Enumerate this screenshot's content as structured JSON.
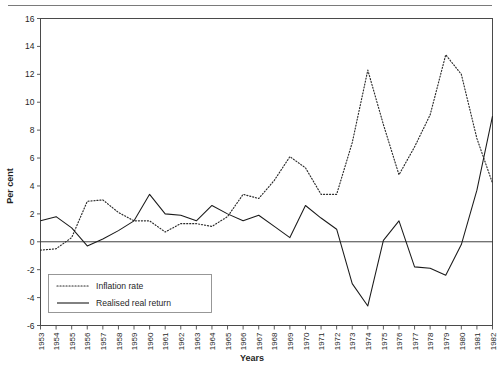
{
  "chart_data": {
    "type": "line",
    "title": "",
    "xlabel": "Years",
    "ylabel": "Per cent",
    "ylim": [
      -6,
      16
    ],
    "ytick_step": 2,
    "yticks": [
      16,
      14,
      12,
      10,
      8,
      6,
      4,
      2,
      0,
      -2,
      -4,
      -6
    ],
    "grid": false,
    "legend_position": "bottom-left",
    "zero_line": true,
    "x": [
      1953,
      1954,
      1955,
      1956,
      1957,
      1958,
      1959,
      1960,
      1961,
      1962,
      1963,
      1964,
      1965,
      1966,
      1967,
      1968,
      1969,
      1970,
      1971,
      1972,
      1973,
      1974,
      1975,
      1976,
      1977,
      1978,
      1979,
      1980,
      1981,
      1982
    ],
    "categories": [
      "1953",
      "1954",
      "1955",
      "1956",
      "1957",
      "1958",
      "1959",
      "1960",
      "1961",
      "1962",
      "1963",
      "1964",
      "1965",
      "1966",
      "1967",
      "1968",
      "1969",
      "1970",
      "1971",
      "1972",
      "1973",
      "1974",
      "1975",
      "1976",
      "1977",
      "1978",
      "1979",
      "1980",
      "1981",
      "1982"
    ],
    "series": [
      {
        "name": "Inflation rate",
        "style": "dotted",
        "color": "#2a2a2a",
        "values": [
          -0.6,
          -0.5,
          0.3,
          2.9,
          3.0,
          2.1,
          1.5,
          1.5,
          0.7,
          1.3,
          1.3,
          1.1,
          1.8,
          3.4,
          3.1,
          4.4,
          6.1,
          5.3,
          3.4,
          3.4,
          7.1,
          12.3,
          8.4,
          4.8,
          6.8,
          9.1,
          13.4,
          12.0,
          7.4,
          4.2
        ]
      },
      {
        "name": "Realised real return",
        "style": "solid",
        "color": "#1a1a1a",
        "values": [
          1.5,
          1.8,
          1.0,
          -0.3,
          0.2,
          0.8,
          1.5,
          3.4,
          2.0,
          1.9,
          1.5,
          2.6,
          2.0,
          1.5,
          1.9,
          1.1,
          0.3,
          2.6,
          1.7,
          0.9,
          -3.0,
          -4.6,
          0.1,
          1.5,
          -1.8,
          -1.9,
          -2.4,
          -0.2,
          3.7,
          9.0
        ]
      }
    ]
  },
  "axes": {
    "y_label": "Per cent",
    "x_label": "Years"
  },
  "legend": {
    "items": [
      {
        "label": "Inflation rate",
        "style": "dotted"
      },
      {
        "label": "Realised real return",
        "style": "solid"
      }
    ]
  }
}
